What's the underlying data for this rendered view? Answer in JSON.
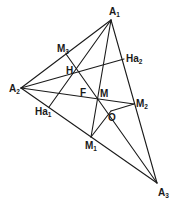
{
  "diagram": {
    "type": "geometry-triangle",
    "points": {
      "A1": {
        "label": "A",
        "sub": "1",
        "x": 111,
        "y": 20
      },
      "A2": {
        "label": "A",
        "sub": "2",
        "x": 21,
        "y": 88
      },
      "A3": {
        "label": "A",
        "sub": "3",
        "x": 157,
        "y": 183
      },
      "M1": {
        "label": "M",
        "sub": "1",
        "x": 91,
        "y": 137
      },
      "M2": {
        "label": "M",
        "sub": "2",
        "x": 134,
        "y": 104
      },
      "M3": {
        "label": "M",
        "sub": "3",
        "x": 66,
        "y": 54
      },
      "Ha1": {
        "label": "Ha",
        "sub": "1",
        "x": 49,
        "y": 107
      },
      "Ha2": {
        "label": "Ha",
        "sub": "2",
        "x": 124,
        "y": 59
      },
      "H": {
        "label": "H",
        "sub": "",
        "x": 73,
        "y": 74
      },
      "F": {
        "label": "F",
        "sub": "",
        "x": 85,
        "y": 94
      },
      "M": {
        "label": "M",
        "sub": "",
        "x": 97,
        "y": 97
      },
      "O": {
        "label": "O",
        "sub": "",
        "x": 111,
        "y": 111
      }
    },
    "segments": [
      [
        "A1",
        "A2"
      ],
      [
        "A2",
        "A3"
      ],
      [
        "A3",
        "A1"
      ],
      [
        "A1",
        "M1"
      ],
      [
        "A2",
        "M2"
      ],
      [
        "A1",
        "Ha1"
      ],
      [
        "A2",
        "Ha2"
      ],
      [
        "M3",
        "A3"
      ],
      [
        "M1",
        "O"
      ],
      [
        "O",
        "M2"
      ]
    ]
  }
}
